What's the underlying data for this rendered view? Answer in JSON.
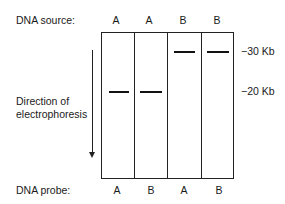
{
  "figure": {
    "source_row": {
      "label": "DNA source:",
      "lanes": [
        "A",
        "A",
        "B",
        "B"
      ]
    },
    "probe_row": {
      "label": "DNA probe:",
      "lanes": [
        "A",
        "B",
        "A",
        "B"
      ]
    },
    "direction_label": {
      "line1": "Direction of",
      "line2": "electrophoresis"
    },
    "size_markers": [
      {
        "label": "−30 Kb",
        "size_kb": 30
      },
      {
        "label": "−20 Kb",
        "size_kb": 20
      }
    ],
    "bands": [
      {
        "lane": 1,
        "size_kb": 20
      },
      {
        "lane": 2,
        "size_kb": 20
      },
      {
        "lane": 3,
        "size_kb": 30
      },
      {
        "lane": 4,
        "size_kb": 30
      }
    ]
  }
}
